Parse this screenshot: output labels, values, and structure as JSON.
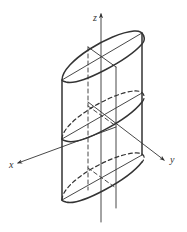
{
  "diagram": {
    "type": "3d-geometry",
    "axes": {
      "x": {
        "label": "x"
      },
      "y": {
        "label": "y"
      },
      "z": {
        "label": "z"
      }
    },
    "colors": {
      "stroke": "#333333",
      "background": "#ffffff"
    }
  }
}
